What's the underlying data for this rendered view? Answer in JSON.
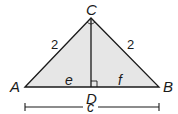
{
  "diagram": {
    "type": "right-triangle-altitude",
    "fill_color": "#e6e6e6",
    "stroke_color": "#1a1a1a",
    "vertices": {
      "A": {
        "label": "A"
      },
      "B": {
        "label": "B"
      },
      "C": {
        "label": "C"
      },
      "D": {
        "label": "D"
      }
    },
    "sides": {
      "AC": "2",
      "BC": "2",
      "AD": "e",
      "DB": "f",
      "AB": "c"
    },
    "markers": [
      "right-angle-at-C",
      "right-angle-at-D"
    ]
  }
}
